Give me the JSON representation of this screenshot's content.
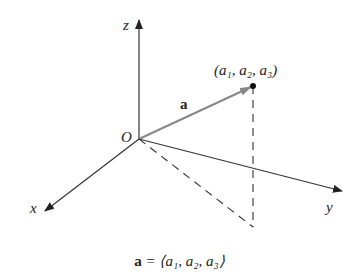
{
  "diagram": {
    "axes": {
      "z_label": "z",
      "x_label": "x",
      "y_label": "y",
      "origin_label": "O"
    },
    "vector": {
      "label": "a",
      "point_label": "(a₁, a₂, a₃)"
    },
    "caption": {
      "lhs": "a",
      "rhs": " = ⟨a₁, a₂, a₃⟩"
    },
    "colors": {
      "axis": "#333333",
      "vector": "#777777",
      "dash": "#333333",
      "text": "#222222"
    }
  }
}
